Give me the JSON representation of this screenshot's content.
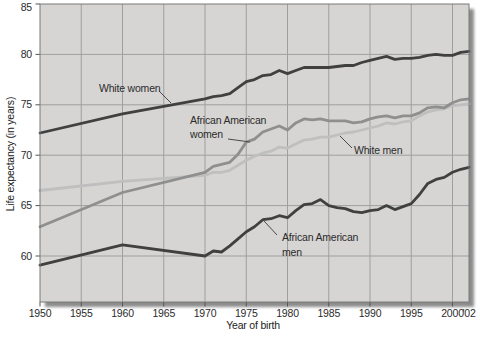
{
  "figure": {
    "xlabel": "Year of birth",
    "ylabel": "Life expectancy (in years)"
  },
  "annotations": {
    "white_women": "White women",
    "aa_women": "African American\nwomen",
    "white_men": "White men",
    "aa_men": "African American\nmen"
  },
  "colors": {
    "plot_background": "#d6d5d3",
    "gridline": "#9f9f9f",
    "plot_border": "#7a7a7a",
    "shadow": "#8b8b8b",
    "dark_line": "#404040",
    "medium_line": "#8f8f8f",
    "light_line": "#bfbfbf",
    "text": "#2b2b2b",
    "leader_line": "#4a4a4a"
  },
  "chart_data": {
    "type": "line",
    "title": "",
    "xlabel": "Year of birth",
    "ylabel": "Life expectancy (in years)",
    "xlim": [
      1950,
      2002
    ],
    "ylim": [
      55.5,
      85
    ],
    "grid": true,
    "legend_position": "inline-annotations",
    "yticks": [
      60,
      65,
      70,
      75,
      80,
      85
    ],
    "xtick_years": [
      1950,
      1955,
      1960,
      1965,
      1970,
      1975,
      1980,
      1985,
      1990,
      1995,
      2000,
      2002
    ],
    "xtick_labels": [
      "1950",
      "1955",
      "1960",
      "1965",
      "1970",
      "1975",
      "1980",
      "1985",
      "1990",
      "1995",
      "2000",
      "'02"
    ],
    "x": [
      1950,
      1960,
      1970,
      1971,
      1972,
      1973,
      1974,
      1975,
      1976,
      1977,
      1978,
      1979,
      1980,
      1981,
      1982,
      1983,
      1984,
      1985,
      1986,
      1987,
      1988,
      1989,
      1990,
      1991,
      1992,
      1993,
      1994,
      1995,
      1996,
      1997,
      1998,
      1999,
      2000,
      2001,
      2002
    ],
    "series": [
      {
        "name": "White women",
        "color": "#404040",
        "values": [
          72.2,
          74.1,
          75.6,
          75.8,
          75.9,
          76.1,
          76.7,
          77.3,
          77.5,
          77.9,
          78.0,
          78.4,
          78.1,
          78.4,
          78.7,
          78.7,
          78.7,
          78.7,
          78.8,
          78.9,
          78.9,
          79.2,
          79.4,
          79.6,
          79.8,
          79.5,
          79.6,
          79.6,
          79.7,
          79.9,
          80.0,
          79.9,
          79.9,
          80.2,
          80.3
        ]
      },
      {
        "name": "African American women",
        "color": "#8f8f8f",
        "values": [
          62.9,
          66.3,
          68.3,
          68.9,
          69.1,
          69.3,
          70.1,
          71.3,
          71.6,
          72.3,
          72.6,
          72.9,
          72.5,
          73.2,
          73.6,
          73.5,
          73.6,
          73.4,
          73.4,
          73.4,
          73.2,
          73.3,
          73.6,
          73.8,
          73.9,
          73.7,
          73.9,
          73.9,
          74.2,
          74.7,
          74.8,
          74.7,
          75.2,
          75.5,
          75.6
        ]
      },
      {
        "name": "White men",
        "color": "#bfbfbf",
        "values": [
          66.5,
          67.4,
          68.0,
          68.3,
          68.3,
          68.5,
          69.0,
          69.5,
          69.9,
          70.2,
          70.4,
          70.8,
          70.7,
          71.1,
          71.5,
          71.6,
          71.8,
          71.8,
          72.0,
          72.2,
          72.3,
          72.5,
          72.7,
          72.9,
          73.2,
          73.1,
          73.3,
          73.4,
          73.9,
          74.3,
          74.5,
          74.6,
          74.9,
          75.0,
          75.1
        ]
      },
      {
        "name": "African American men",
        "color": "#404040",
        "values": [
          59.1,
          61.1,
          60.0,
          60.5,
          60.4,
          61.0,
          61.7,
          62.4,
          62.9,
          63.6,
          63.7,
          64.0,
          63.8,
          64.5,
          65.1,
          65.2,
          65.6,
          65.0,
          64.8,
          64.7,
          64.4,
          64.3,
          64.5,
          64.6,
          65.0,
          64.6,
          64.9,
          65.2,
          66.1,
          67.2,
          67.6,
          67.8,
          68.3,
          68.6,
          68.8
        ]
      }
    ]
  }
}
